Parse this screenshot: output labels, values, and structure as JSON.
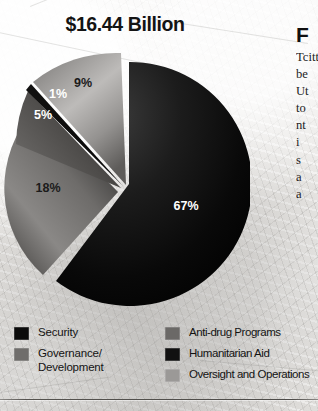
{
  "title": "$16.44 Billion",
  "chart_data": {
    "type": "pie",
    "title": "$16.44 Billion",
    "total_label": "$16.44 Billion",
    "total_value": 16.44,
    "units": "USD billions",
    "legend_position": "bottom",
    "exploded": true,
    "grid": false,
    "categories": [
      "Security",
      "Governance/Development",
      "Anti-drug Programs",
      "Humanitarian Aid",
      "Oversight and Operations"
    ],
    "values": [
      67,
      18,
      5,
      1,
      9
    ],
    "data_labels": [
      "67%",
      "18%",
      "5%",
      "1%",
      "9%"
    ],
    "colors": [
      "#0b0b0b",
      "#6f6d6b",
      "#4a4846",
      "#121212",
      "#9b9997"
    ]
  },
  "slices": [
    {
      "label": "67%",
      "value": 67,
      "name": "Security",
      "color": "#0b0b0b",
      "text_color": "light"
    },
    {
      "label": "18%",
      "value": 18,
      "name": "Governance/Development",
      "color": "#6f6d6b",
      "text_color": "dark"
    },
    {
      "label": "5%",
      "value": 5,
      "name": "Anti-drug Programs",
      "color": "#4a4846",
      "text_color": "light"
    },
    {
      "label": "1%",
      "value": 1,
      "name": "Humanitarian Aid",
      "color": "#121212",
      "text_color": "light"
    },
    {
      "label": "9%",
      "value": 9,
      "name": "Oversight and Operations",
      "color": "#9b9997",
      "text_color": "dark"
    }
  ],
  "legend": {
    "left": [
      {
        "label": "Security",
        "swatch": "#0b0b0b"
      },
      {
        "label": "Governance/\nDevelopment",
        "swatch": "#6f6d6b"
      }
    ],
    "right": [
      {
        "label": "Anti-drug Programs",
        "swatch": "#6b6967"
      },
      {
        "label": "Humanitarian Aid",
        "swatch": "#111111"
      },
      {
        "label": "Oversight and Operations",
        "swatch": "#9b9997"
      }
    ]
  },
  "side_column": {
    "heading": "F",
    "body": "Tcitteti be Ut to nt i s a a"
  }
}
